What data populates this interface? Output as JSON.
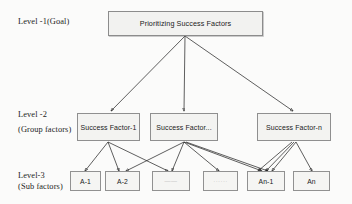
{
  "diagram": {
    "title_node": {
      "label": "Prioritizing Success Factors"
    },
    "levels": [
      {
        "name": "level-1",
        "line1": "Level -1(Goal)",
        "line2": ""
      },
      {
        "name": "level-2",
        "line1": "Level -2",
        "line2": "(Group factors)"
      },
      {
        "name": "level-3",
        "line1": "Level-3",
        "line2": "(Sub factors)"
      }
    ],
    "group_factors": [
      {
        "label": "Success Factor-1"
      },
      {
        "label": "Success Factor..."
      },
      {
        "label": "Success Factor-n"
      }
    ],
    "sub_factors": [
      {
        "label": "A-1"
      },
      {
        "label": "A-2"
      },
      {
        "label": "——"
      },
      {
        "label": "······"
      },
      {
        "label": "An-1"
      },
      {
        "label": "An"
      }
    ],
    "colors": {
      "background": "#fbfbfa",
      "box_fill": "#f3f3f1",
      "box_border": "#8f8f8f",
      "connector": "#1b1b1b",
      "text": "#1a1a1a"
    }
  }
}
